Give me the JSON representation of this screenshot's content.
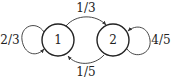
{
  "diagram": {
    "type": "markov-chain",
    "nodes": [
      {
        "id": "1",
        "label": "1"
      },
      {
        "id": "2",
        "label": "2"
      }
    ],
    "edges": [
      {
        "from": "1",
        "to": "1",
        "label": "2/3"
      },
      {
        "from": "1",
        "to": "2",
        "label": "1/3"
      },
      {
        "from": "2",
        "to": "1",
        "label": "1/5"
      },
      {
        "from": "2",
        "to": "2",
        "label": "4/5"
      }
    ]
  }
}
